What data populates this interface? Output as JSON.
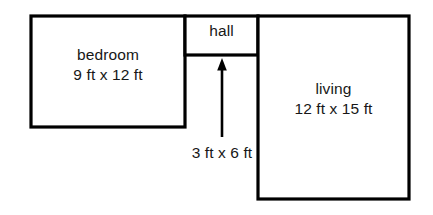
{
  "diagram": {
    "background_color": "#ffffff",
    "line_color": "#000000",
    "text_color": "#171717",
    "rooms": [
      {
        "id": "bedroom",
        "name": "bedroom",
        "dimensions": "9 ft x 12 ft",
        "width_ft": 9,
        "length_ft": 12
      },
      {
        "id": "hall",
        "name": "hall",
        "dimensions": "3 ft x 6 ft",
        "width_ft": 3,
        "length_ft": 6
      },
      {
        "id": "living",
        "name": "living",
        "dimensions": "12 ft x 15 ft",
        "width_ft": 12,
        "length_ft": 15
      }
    ],
    "annotation": {
      "label": "3 ft x 6 ft",
      "points_to": "hall",
      "arrow_direction": "up"
    }
  }
}
